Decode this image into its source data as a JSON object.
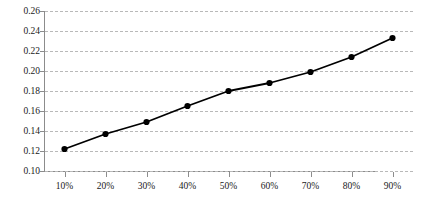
{
  "chart_data": {
    "type": "line",
    "title": "",
    "subtitle": "",
    "xlabel": "",
    "ylabel": "",
    "categories": [
      "10%",
      "20%",
      "30%",
      "40%",
      "50%",
      "60%",
      "70%",
      "80%",
      "90%"
    ],
    "x": [
      10,
      20,
      30,
      40,
      50,
      60,
      70,
      80,
      90
    ],
    "values": [
      0.122,
      0.137,
      0.149,
      0.165,
      0.18,
      0.188,
      0.199,
      0.214,
      0.233
    ],
    "series": [
      {
        "name": "series-1",
        "values": [
          0.122,
          0.137,
          0.149,
          0.165,
          0.18,
          0.188,
          0.199,
          0.214,
          0.233
        ],
        "color": "#000000",
        "marker": "circle",
        "line_style": "solid"
      }
    ],
    "ylim": [
      0.1,
      0.26
    ],
    "xlim": [
      5,
      95
    ],
    "y_ticks": [
      "0.26",
      "0.24",
      "0.22",
      "0.20",
      "0.18",
      "0.16",
      "0.14",
      "0.12",
      "0.10"
    ],
    "y_tick_values": [
      0.26,
      0.24,
      0.22,
      0.2,
      0.18,
      0.16,
      0.14,
      0.12,
      0.1
    ],
    "x_ticks": [
      "10%",
      "20%",
      "30%",
      "40%",
      "50%",
      "60%",
      "70%",
      "80%",
      "90%"
    ],
    "grid": true,
    "grid_axis": "y",
    "grid_style": "dashed",
    "grid_color": "#b9b9b9",
    "legend": false,
    "legend_position": "none",
    "axis_color": "#8c8c8c",
    "background": "#ffffff",
    "annotations": []
  },
  "caption": {
    "text": ""
  }
}
